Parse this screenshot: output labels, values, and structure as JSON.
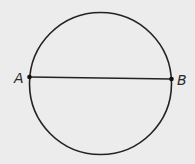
{
  "diagram": {
    "type": "circle-with-diameter",
    "background": "#ececec",
    "stroke_color": "#222222",
    "circle": {
      "cx": 100.5,
      "cy": 83.5,
      "r": 71
    },
    "segment": {
      "from": "A",
      "to": "B"
    },
    "points": [
      {
        "label": "A",
        "x": 29,
        "y": 77
      },
      {
        "label": "B",
        "x": 171.5,
        "y": 79
      }
    ]
  }
}
